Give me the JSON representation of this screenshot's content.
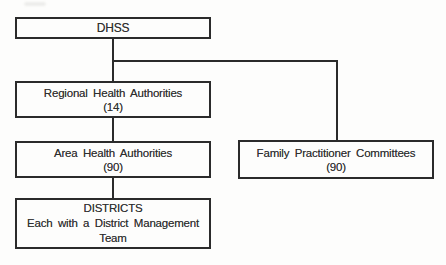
{
  "canvas": {
    "width_px": 446,
    "height_px": 265
  },
  "colors": {
    "ink": "#2b2b2b",
    "text": "#2f2f2f",
    "paper": "#fdfdfc"
  },
  "diagram": {
    "type": "org-chart",
    "nodes": {
      "dhss": {
        "lines": [
          "DHSS"
        ]
      },
      "regional": {
        "lines": [
          "Regional Health Authorities",
          "(14)"
        ]
      },
      "area": {
        "lines": [
          "Area Health Authorities",
          "(90)"
        ]
      },
      "family": {
        "lines": [
          "Family Practitioner Committees",
          "(90)"
        ]
      },
      "districts": {
        "lines": [
          "DISTRICTS",
          "Each with a District Management",
          "Team"
        ]
      }
    },
    "edges": [
      {
        "from": "DHSS",
        "to": "Regional Health Authorities"
      },
      {
        "from": "DHSS",
        "to": "Family Practitioner Committees"
      },
      {
        "from": "Regional Health Authorities",
        "to": "Area Health Authorities"
      },
      {
        "from": "Area Health Authorities",
        "to": "DISTRICTS"
      }
    ]
  }
}
